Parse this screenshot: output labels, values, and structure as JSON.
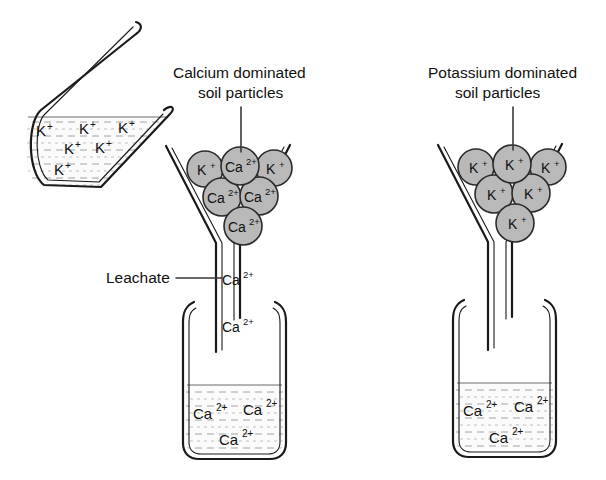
{
  "figure": {
    "background_color": "#ffffff",
    "particle_fill": "#b9b9b9",
    "outline_color": "#1a1a1a",
    "liquid_color": "#fbfbfb"
  },
  "captions": {
    "calcium_label_line1": "Calcium dominated",
    "calcium_label_line2": "soil particles",
    "potassium_label_line1": "Potassium dominated",
    "potassium_label_line2": "soil particles",
    "leachate_label": "Leachate"
  },
  "pitcher": {
    "name": "potassium solution pitcher",
    "ions": [
      {
        "symbol": "K",
        "charge": "+",
        "x": 42,
        "y": 131
      },
      {
        "symbol": "K",
        "charge": "+",
        "x": 85,
        "y": 129
      },
      {
        "symbol": "K",
        "charge": "+",
        "x": 124,
        "y": 128
      },
      {
        "symbol": "K",
        "charge": "+",
        "x": 70,
        "y": 149
      },
      {
        "symbol": "K",
        "charge": "+",
        "x": 101,
        "y": 148
      },
      {
        "symbol": "K",
        "charge": "+",
        "x": 60,
        "y": 170
      }
    ]
  },
  "left_funnel": {
    "name": "calcium dominated funnel",
    "particles": [
      {
        "symbol": "K",
        "charge": "+",
        "cx": 205,
        "cy": 169,
        "r": 18
      },
      {
        "symbol": "Ca",
        "charge": "2+",
        "cx": 240,
        "cy": 166,
        "r": 19
      },
      {
        "symbol": "K",
        "charge": "+",
        "cx": 274,
        "cy": 168,
        "r": 18
      },
      {
        "symbol": "Ca",
        "charge": "2+",
        "cx": 222,
        "cy": 197,
        "r": 19
      },
      {
        "symbol": "Ca",
        "charge": "2+",
        "cx": 259,
        "cy": 196,
        "r": 19
      },
      {
        "symbol": "Ca",
        "charge": "2+",
        "cx": 243,
        "cy": 226,
        "r": 19
      }
    ],
    "drips": [
      {
        "symbol": "Ca",
        "charge": "2+",
        "x": 222,
        "y": 280
      },
      {
        "symbol": "Ca",
        "charge": "2+",
        "x": 222,
        "y": 327
      }
    ]
  },
  "right_funnel": {
    "name": "potassium dominated funnel",
    "particles": [
      {
        "symbol": "K",
        "charge": "+",
        "cx": 476,
        "cy": 167,
        "r": 18
      },
      {
        "symbol": "K",
        "charge": "+",
        "cx": 512,
        "cy": 164,
        "r": 19
      },
      {
        "symbol": "K",
        "charge": "+",
        "cx": 548,
        "cy": 167,
        "r": 18
      },
      {
        "symbol": "K",
        "charge": "+",
        "cx": 494,
        "cy": 194,
        "r": 19
      },
      {
        "symbol": "K",
        "charge": "+",
        "cx": 531,
        "cy": 193,
        "r": 19
      },
      {
        "symbol": "K",
        "charge": "+",
        "cx": 515,
        "cy": 223,
        "r": 19
      }
    ],
    "drips": []
  },
  "left_beaker": {
    "name": "left collection beaker",
    "ions": [
      {
        "symbol": "Ca",
        "charge": "2+",
        "x": 202,
        "y": 414
      },
      {
        "symbol": "Ca",
        "charge": "2+",
        "x": 256,
        "y": 409
      },
      {
        "symbol": "Ca",
        "charge": "2+",
        "x": 230,
        "y": 440
      }
    ]
  },
  "right_beaker": {
    "name": "right collection beaker",
    "ions": [
      {
        "symbol": "Ca",
        "charge": "2+",
        "x": 472,
        "y": 411
      },
      {
        "symbol": "Ca",
        "charge": "2+",
        "x": 527,
        "y": 407
      },
      {
        "symbol": "Ca",
        "charge": "2+",
        "x": 500,
        "y": 438
      }
    ]
  }
}
